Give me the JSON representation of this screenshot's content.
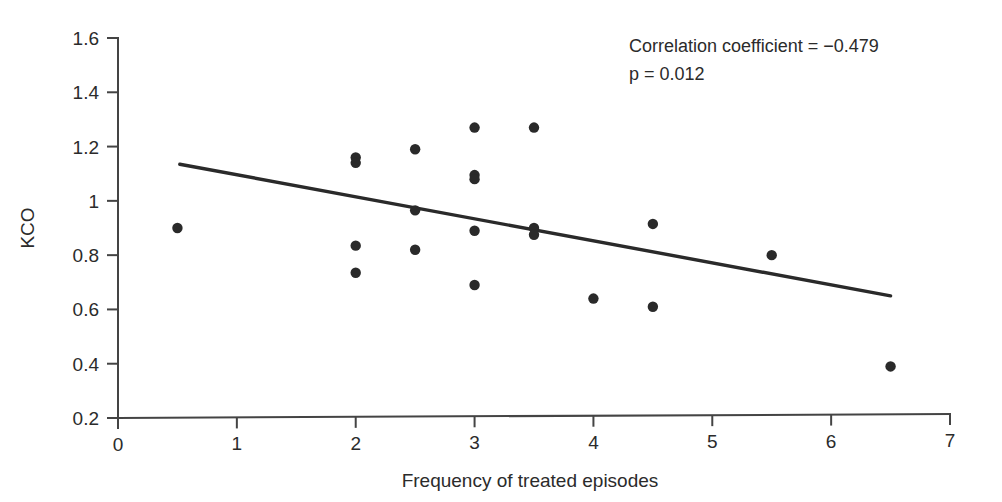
{
  "chart_data": {
    "type": "scatter",
    "title": "",
    "xlabel": "Frequency of treated episodes",
    "ylabel": "KCO",
    "xlim": [
      0,
      7
    ],
    "ylim": [
      0.2,
      1.6
    ],
    "grid": false,
    "legend": null,
    "xticks": [
      "0",
      "1",
      "2",
      "3",
      "4",
      "5",
      "6",
      "7"
    ],
    "xtick_values": [
      0,
      1,
      2,
      3,
      4,
      5,
      6,
      7
    ],
    "yticks": [
      "0.2",
      "0.4",
      "0.6",
      "0.8",
      "1",
      "1.2",
      "1.4",
      "1.6"
    ],
    "ytick_values": [
      0.2,
      0.4,
      0.6,
      0.8,
      1.0,
      1.2,
      1.4,
      1.6
    ],
    "points": [
      {
        "x": 0.5,
        "y": 0.9
      },
      {
        "x": 2.0,
        "y": 1.16
      },
      {
        "x": 2.0,
        "y": 1.14
      },
      {
        "x": 2.0,
        "y": 0.835
      },
      {
        "x": 2.0,
        "y": 0.735
      },
      {
        "x": 2.5,
        "y": 1.19
      },
      {
        "x": 2.5,
        "y": 0.965
      },
      {
        "x": 2.5,
        "y": 0.82
      },
      {
        "x": 3.0,
        "y": 1.27
      },
      {
        "x": 3.0,
        "y": 1.095
      },
      {
        "x": 3.0,
        "y": 1.08
      },
      {
        "x": 3.0,
        "y": 0.89
      },
      {
        "x": 3.0,
        "y": 0.69
      },
      {
        "x": 3.5,
        "y": 1.27
      },
      {
        "x": 3.5,
        "y": 0.9
      },
      {
        "x": 3.5,
        "y": 0.875
      },
      {
        "x": 4.0,
        "y": 0.64
      },
      {
        "x": 4.5,
        "y": 0.915
      },
      {
        "x": 4.5,
        "y": 0.61
      },
      {
        "x": 5.5,
        "y": 0.8
      },
      {
        "x": 6.5,
        "y": 0.39
      }
    ],
    "fit_line": {
      "x0": 0.52,
      "y0": 1.135,
      "x1": 6.5,
      "y1": 0.65
    },
    "marker_color": "#2a2a2a",
    "line_color": "#2a2a2a"
  },
  "annotation": {
    "correlation": "Correlation coefficient = −0.479",
    "pvalue": "p = 0.012"
  }
}
